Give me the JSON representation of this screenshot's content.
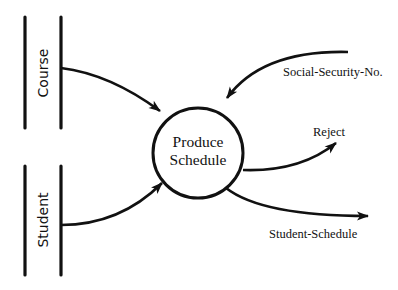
{
  "diagram": {
    "type": "data-flow-diagram",
    "process": {
      "line1": "Produce",
      "line2": "Schedule"
    },
    "stores": [
      {
        "label": "Course"
      },
      {
        "label": "Student"
      }
    ],
    "flows": [
      {
        "label": "",
        "from": "Course",
        "to": "Produce Schedule"
      },
      {
        "label": "",
        "from": "Student",
        "to": "Produce Schedule"
      },
      {
        "label": "Social-Security-No.",
        "from": "external",
        "to": "Produce Schedule"
      },
      {
        "label": "Reject",
        "from": "Produce Schedule",
        "to": "external"
      },
      {
        "label": "Student-Schedule",
        "from": "Produce Schedule",
        "to": "external"
      }
    ],
    "colors": {
      "ink": "#111111",
      "background": "#ffffff"
    }
  }
}
